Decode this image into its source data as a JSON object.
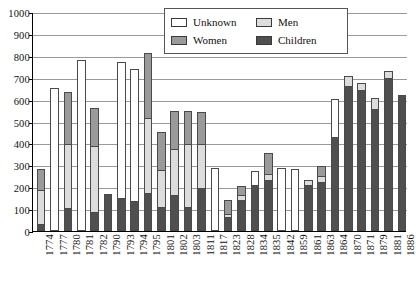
{
  "chart_data": {
    "type": "bar",
    "stacked": true,
    "title": "",
    "subtitle": "",
    "xlabel": "",
    "ylabel": "",
    "ylim": [
      0,
      1000
    ],
    "ytick_step": 100,
    "yticks": [
      "0",
      "100",
      "200",
      "300",
      "400",
      "500",
      "600",
      "700",
      "800",
      "900",
      "1000"
    ],
    "grid": true,
    "legend_position": "top-center",
    "categories": [
      "1774",
      "1777",
      "1780",
      "1781",
      "1782",
      "1790",
      "1793",
      "1794",
      "1795",
      "1801",
      "1802",
      "1803",
      "1811",
      "1817",
      "1823",
      "1828",
      "1834",
      "1835",
      "1842",
      "1859",
      "1861",
      "1863",
      "1864",
      "1870",
      "1871",
      "1879",
      "1881",
      "1886"
    ],
    "series": [
      {
        "name": "Children",
        "color": "#4f4f4f",
        "values": [
          30,
          0,
          105,
          0,
          88,
          170,
          150,
          138,
          172,
          110,
          165,
          110,
          195,
          0,
          62,
          140,
          212,
          235,
          0,
          0,
          208,
          225,
          430,
          660,
          645,
          555,
          700,
          620
        ]
      },
      {
        "name": "Men",
        "color": "#dcdcdc",
        "values": [
          163,
          0,
          298,
          0,
          305,
          0,
          0,
          0,
          350,
          175,
          215,
          290,
          205,
          0,
          18,
          30,
          0,
          30,
          0,
          0,
          30,
          30,
          0,
          50,
          35,
          55,
          35,
          0
        ]
      },
      {
        "name": "Women",
        "color": "#9a9a9a",
        "values": [
          98,
          0,
          240,
          0,
          175,
          0,
          0,
          0,
          300,
          175,
          175,
          155,
          150,
          0,
          70,
          45,
          0,
          100,
          0,
          0,
          0,
          50,
          0,
          0,
          0,
          0,
          0,
          0
        ]
      },
      {
        "name": "Unknown",
        "color": "#ffffff",
        "values": [
          0,
          652,
          0,
          782,
          0,
          0,
          628,
          608,
          0,
          0,
          0,
          0,
          0,
          290,
          0,
          0,
          68,
          0,
          290,
          282,
          0,
          0,
          175,
          0,
          0,
          0,
          0,
          0
        ]
      }
    ],
    "totals": [
      291,
      652,
      643,
      782,
      568,
      170,
      778,
      746,
      822,
      460,
      555,
      555,
      550,
      290,
      150,
      215,
      280,
      365,
      290,
      282,
      238,
      305,
      605,
      710,
      680,
      610,
      735,
      620
    ]
  },
  "legend": {
    "items": [
      {
        "label": "Unknown",
        "swatch": "swatch-unknown"
      },
      {
        "label": "Men",
        "swatch": "swatch-men"
      },
      {
        "label": "Women",
        "swatch": "swatch-women"
      },
      {
        "label": "Children",
        "swatch": "swatch-children"
      }
    ]
  }
}
